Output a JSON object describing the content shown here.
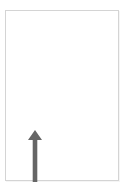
{
  "colors": {
    "window_background": "#ffffff",
    "page_background": "#ffffff",
    "page_border": "#d4d4d4",
    "arrow": "#666666"
  },
  "arrow": {
    "icon": "arrow-up-icon",
    "direction": "up"
  }
}
